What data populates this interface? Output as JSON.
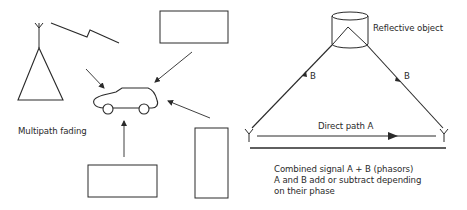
{
  "left_panel": {
    "caption": "Multipath fading"
  },
  "right_panel": {
    "reflector_label": "Reflective object",
    "path_b_left_label": "B",
    "path_b_right_label": "B",
    "direct_path_label": "Direct path A",
    "description_lines": [
      "Combined signal A + B (phasors)",
      "A and B add or subtract depending",
      "on their phase"
    ]
  },
  "colors": {
    "stroke": "#2a2a2a",
    "background": "#ffffff"
  }
}
